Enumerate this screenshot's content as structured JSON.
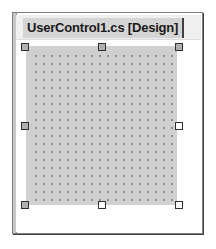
{
  "document_tab": {
    "label": "UserControl1.cs [Design]",
    "active": true
  },
  "designer": {
    "surface": "UserControl1",
    "grid_visible": true,
    "selection_handles": [
      "top-left",
      "top-center",
      "top-right",
      "middle-left",
      "middle-right",
      "bottom-left",
      "bottom-center",
      "bottom-right"
    ]
  },
  "colors": {
    "surface": "#cfcfcf",
    "grid_dot": "#8a8a8a",
    "tab_background": "#d4d4d4",
    "frame_border": "#808080"
  }
}
